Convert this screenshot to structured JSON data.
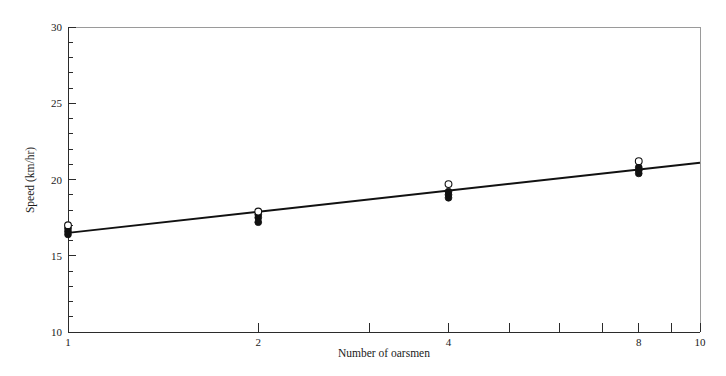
{
  "chart_data": {
    "type": "scatter",
    "title": "",
    "xlabel": "Number of oarsmen",
    "ylabel": "Speed (km/hr)",
    "xscale": "log",
    "xlim": [
      1,
      10
    ],
    "ylim": [
      10,
      30
    ],
    "grid": false,
    "legend_position": "none",
    "x_tick_labels": [
      "1",
      "2",
      "4",
      "8",
      "10"
    ],
    "x_tick_values": [
      1,
      2,
      4,
      8,
      10
    ],
    "x_minor_ticks": [
      3,
      5,
      6,
      7,
      9
    ],
    "y_tick_labels": [
      "10",
      "15",
      "20",
      "25",
      "30"
    ],
    "y_tick_values": [
      10,
      15,
      20,
      25,
      30
    ],
    "y_minor_tick_step": 1,
    "series": [
      {
        "name": "open-circle-records",
        "marker": "open-circle",
        "x": [
          1,
          2,
          4,
          8
        ],
        "values": [
          17.0,
          17.9,
          19.7,
          21.2
        ]
      },
      {
        "name": "filled-circle-observations",
        "marker": "filled-circle",
        "x": [
          1,
          1,
          1,
          2,
          2,
          2,
          4,
          4,
          4,
          8,
          8,
          8
        ],
        "values": [
          16.8,
          16.6,
          16.4,
          17.7,
          17.5,
          17.2,
          19.2,
          19.0,
          18.8,
          20.8,
          20.6,
          20.4
        ]
      }
    ],
    "fit_line": {
      "name": "fitted-trend-line",
      "x_start": 1,
      "y_start": 16.5,
      "x_end": 10,
      "y_end": 21.1
    }
  },
  "axes": {
    "x_title": "Number of oarsmen",
    "y_title": "Speed (km/hr)"
  }
}
